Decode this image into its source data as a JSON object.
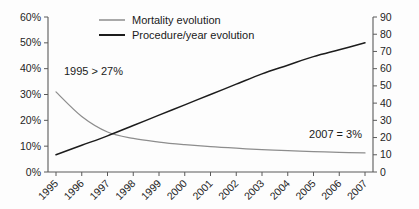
{
  "chart_data": {
    "type": "line",
    "title": "",
    "subtitle": "",
    "xlabel": "",
    "ylabel": "",
    "ylabel_right": "",
    "grid": false,
    "legend_position": "top-center",
    "categories": [
      "1995",
      "1996",
      "1997",
      "1998",
      "1999",
      "2000",
      "2001",
      "2002",
      "2003",
      "2004",
      "2005",
      "2006",
      "2007"
    ],
    "x": [
      1995,
      1996,
      1997,
      1998,
      1999,
      2000,
      2001,
      2002,
      2003,
      2004,
      2005,
      2006,
      2007
    ],
    "ylim": [
      0,
      60
    ],
    "ylim_right": [
      0,
      90
    ],
    "yticks": [
      "0%",
      "10%",
      "20%",
      "30%",
      "40%",
      "50%",
      "60%"
    ],
    "ytick_values": [
      0,
      10,
      20,
      30,
      40,
      50,
      60
    ],
    "yticks_right": [
      "0",
      "10",
      "20",
      "30",
      "40",
      "50",
      "60",
      "70",
      "80",
      "90"
    ],
    "ytick_values_right": [
      0,
      10,
      20,
      30,
      40,
      50,
      60,
      70,
      80,
      90
    ],
    "series": [
      {
        "name": "Mortality evolution",
        "axis": "left",
        "color": "#8d8d8d",
        "unit": "%",
        "values": [
          31,
          21.5,
          15.5,
          13.0,
          11.6,
          10.6,
          9.8,
          9.2,
          8.7,
          8.3,
          7.9,
          7.6,
          7.4
        ]
      },
      {
        "name": "Procedure/year evolution",
        "axis": "right",
        "color": "#1c1c1c",
        "unit": "",
        "values": [
          10,
          15.5,
          21,
          27,
          33,
          39,
          45,
          51,
          57,
          62,
          67,
          71,
          75
        ]
      }
    ],
    "annotations": [
      {
        "text": "1995 > 27%",
        "x": 1995.1,
        "y": 36,
        "axis": "left",
        "align": "start"
      },
      {
        "text": "2007 = 3%",
        "x": 2006.9,
        "y": 12.5,
        "axis": "left",
        "align": "end"
      }
    ]
  },
  "legend": {
    "items": [
      {
        "label": "Mortality evolution"
      },
      {
        "label": "Procedure/year evolution"
      }
    ]
  },
  "axes": {
    "left_labels": [
      "60%",
      "50%",
      "40%",
      "30%",
      "20%",
      "10%",
      "0%"
    ],
    "right_labels": [
      "90",
      "80",
      "70",
      "60",
      "50",
      "40",
      "30",
      "20",
      "10",
      "0"
    ],
    "x_labels": [
      "1995",
      "1996",
      "1997",
      "1998",
      "1999",
      "2000",
      "2001",
      "2002",
      "2003",
      "2004",
      "2005",
      "2006",
      "2007"
    ]
  },
  "annotations": {
    "start_note": "1995 > 27%",
    "end_note": "2007 = 3%"
  }
}
